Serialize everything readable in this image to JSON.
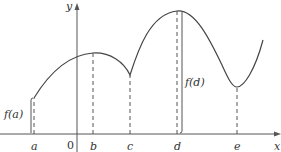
{
  "figure": {
    "axes": {
      "x_label": "x",
      "y_label": "y",
      "origin_label": "0"
    },
    "points": [
      {
        "label": "a",
        "x": 34
      },
      {
        "label": "b",
        "x": 93
      },
      {
        "label": "c",
        "x": 130
      },
      {
        "label": "d",
        "x": 177
      },
      {
        "label": "e",
        "x": 237
      }
    ],
    "value_labels": {
      "fa": "f(a)",
      "fd": "f(d)"
    },
    "colors": {
      "curve": "#444444",
      "axis": "#555555",
      "dashed": "#555555"
    }
  }
}
